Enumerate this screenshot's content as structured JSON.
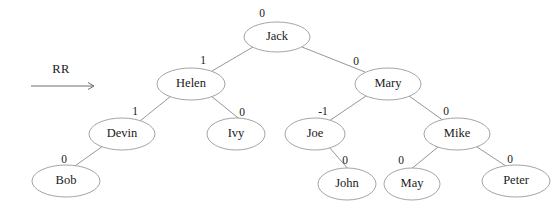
{
  "diagram": {
    "kind": "avl-tree",
    "operation": {
      "label": "RR",
      "arrow_icon": "right-arrow-icon"
    },
    "stroke_color": "#9a9a9a",
    "text_color": "#1a1a1a",
    "background_color": "#ffffff",
    "nodes": [
      {
        "id": "jack",
        "label": "Jack",
        "balance": "0",
        "cx": 277,
        "cy": 37,
        "rx": 33,
        "ry": 15
      },
      {
        "id": "helen",
        "label": "Helen",
        "balance": "1",
        "cx": 191,
        "cy": 84,
        "rx": 34,
        "ry": 16
      },
      {
        "id": "mary",
        "label": "Mary",
        "balance": "0",
        "cx": 388,
        "cy": 84,
        "rx": 33,
        "ry": 16
      },
      {
        "id": "devin",
        "label": "Devin",
        "balance": "1",
        "cx": 122,
        "cy": 134,
        "rx": 33,
        "ry": 16
      },
      {
        "id": "ivy",
        "label": "Ivy",
        "balance": "0",
        "cx": 236,
        "cy": 134,
        "rx": 29,
        "ry": 16
      },
      {
        "id": "joe",
        "label": "Joe",
        "balance": "-1",
        "cx": 315,
        "cy": 134,
        "rx": 30,
        "ry": 16
      },
      {
        "id": "mike",
        "label": "Mike",
        "balance": "0",
        "cx": 457,
        "cy": 134,
        "rx": 33,
        "ry": 16
      },
      {
        "id": "bob",
        "label": "Bob",
        "balance": "0",
        "cx": 66,
        "cy": 181,
        "rx": 34,
        "ry": 16
      },
      {
        "id": "john",
        "label": "John",
        "balance": "0",
        "cx": 347,
        "cy": 184,
        "rx": 29,
        "ry": 16
      },
      {
        "id": "may",
        "label": "May",
        "balance": "0",
        "cx": 412,
        "cy": 184,
        "rx": 28,
        "ry": 16
      },
      {
        "id": "peter",
        "label": "Peter",
        "balance": "0",
        "cx": 516,
        "cy": 181,
        "rx": 34,
        "ry": 16
      }
    ],
    "balance_label_positions": [
      {
        "id": "jack",
        "x": 262,
        "y": 14
      },
      {
        "id": "helen",
        "x": 203,
        "y": 61
      },
      {
        "id": "mary",
        "x": 356,
        "y": 62
      },
      {
        "id": "devin",
        "x": 135,
        "y": 112
      },
      {
        "id": "ivy",
        "x": 242,
        "y": 113
      },
      {
        "id": "joe",
        "x": 323,
        "y": 112
      },
      {
        "id": "mike",
        "x": 446,
        "y": 112
      },
      {
        "id": "bob",
        "x": 64,
        "y": 160
      },
      {
        "id": "john",
        "x": 345,
        "y": 161
      },
      {
        "id": "may",
        "x": 401,
        "y": 161
      },
      {
        "id": "peter",
        "x": 510,
        "y": 160
      }
    ],
    "edges": [
      {
        "from": "jack",
        "to": "helen",
        "x1": 253,
        "y1": 47,
        "x2": 212,
        "y2": 71
      },
      {
        "from": "jack",
        "to": "mary",
        "x1": 302,
        "y1": 47,
        "x2": 365,
        "y2": 72
      },
      {
        "from": "helen",
        "to": "devin",
        "x1": 171,
        "y1": 96,
        "x2": 140,
        "y2": 121
      },
      {
        "from": "helen",
        "to": "ivy",
        "x1": 211,
        "y1": 96,
        "x2": 242,
        "y2": 121
      },
      {
        "from": "mary",
        "to": "joe",
        "x1": 366,
        "y1": 96,
        "x2": 329,
        "y2": 121
      },
      {
        "from": "mary",
        "to": "mike",
        "x1": 409,
        "y1": 96,
        "x2": 444,
        "y2": 121
      },
      {
        "from": "devin",
        "to": "bob",
        "x1": 103,
        "y1": 146,
        "x2": 72,
        "y2": 168
      },
      {
        "from": "joe",
        "to": "john",
        "x1": 329,
        "y1": 147,
        "x2": 349,
        "y2": 170
      },
      {
        "from": "mike",
        "to": "may",
        "x1": 438,
        "y1": 147,
        "x2": 410,
        "y2": 170
      },
      {
        "from": "mike",
        "to": "peter",
        "x1": 477,
        "y1": 147,
        "x2": 509,
        "y2": 168
      }
    ],
    "operation_geometry": {
      "label_x": 61,
      "label_y": 70,
      "arrow_x1": 31,
      "arrow_x2": 94,
      "arrow_y": 86
    }
  }
}
